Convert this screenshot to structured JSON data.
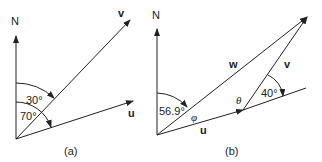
{
  "diagram_a": {
    "caption": "(a)",
    "north_label": "N",
    "vector_v_label": "v",
    "vector_u_label": "u",
    "angle_v_label": "30°",
    "angle_u_label": "70°"
  },
  "diagram_b": {
    "caption": "(b)",
    "north_label": "N",
    "vector_w_label": "w",
    "vector_v_label": "v",
    "vector_u_label": "u",
    "angle_w_label": "56.9°",
    "angle_phi_label": "φ",
    "angle_theta_label": "θ",
    "angle_40_label": "40°"
  },
  "colors": {
    "line": "#222222",
    "background": "#ffffff"
  }
}
